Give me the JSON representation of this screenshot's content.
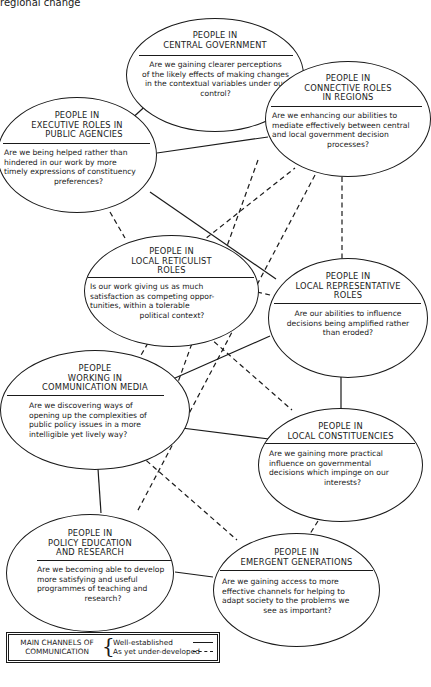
{
  "caption": "regional change",
  "nodes": [
    {
      "id": "central",
      "title": [
        "PEOPLE IN",
        "CENTRAL GOVERNMENT"
      ],
      "question": [
        "Are we gaining clearer perceptions",
        "of the likely effects of making changes",
        "in the contextual variables under our",
        "control?"
      ]
    },
    {
      "id": "connective",
      "title": [
        "PEOPLE IN",
        "CONNECTIVE ROLES",
        "IN REGIONS"
      ],
      "question": [
        "Are we enhancing our abilities to",
        "mediate effectively between central",
        "and local government decision",
        "processes?"
      ]
    },
    {
      "id": "executive",
      "title": [
        "PEOPLE IN",
        "EXECUTIVE ROLES IN",
        "PUBLIC AGENCIES"
      ],
      "question": [
        "Are we being helped rather than",
        "hindered in our work by more",
        "timely expressions of constituency",
        "preferences?"
      ]
    },
    {
      "id": "reticulist",
      "title": [
        "PEOPLE IN",
        "LOCAL RETICULIST",
        "ROLES"
      ],
      "question": [
        "Is our work giving us as much",
        "satisfaction as competing oppor-",
        "tunities, within a tolerable",
        "political context?"
      ]
    },
    {
      "id": "representative",
      "title": [
        "PEOPLE IN",
        "LOCAL REPRESENTATIVE",
        "ROLES"
      ],
      "question": [
        "Are our abilities to influence",
        "decisions being amplified rather",
        "than eroded?"
      ]
    },
    {
      "id": "media",
      "title": [
        "PEOPLE",
        "WORKING IN",
        "COMMUNICATION MEDIA"
      ],
      "question": [
        "Are we discovering ways of",
        "opening up the complexities of",
        "public policy issues in a more",
        "intelligible yet lively way?"
      ]
    },
    {
      "id": "constituencies",
      "title": [
        "PEOPLE IN",
        "LOCAL CONSTITUENCIES"
      ],
      "question": [
        "Are we gaining more practical",
        "influence on governmental",
        "decisions which impinge on our",
        "interests?"
      ]
    },
    {
      "id": "education",
      "title": [
        "PEOPLE IN",
        "POLICY EDUCATION",
        "AND RESEARCH"
      ],
      "question": [
        "Are we becoming able to develop",
        "more satisfying and useful",
        "programmes of teaching and",
        "research?"
      ]
    },
    {
      "id": "emergent",
      "title": [
        "PEOPLE IN",
        "EMERGENT GENERATIONS"
      ],
      "question": [
        "Are we gaining access to more",
        "effective channels for helping to",
        "adapt society to the problems we",
        "see as important?"
      ]
    }
  ],
  "links": {
    "well_established": [
      [
        "central",
        "executive"
      ],
      [
        "central",
        "connective"
      ],
      [
        "executive",
        "connective"
      ],
      [
        "executive",
        "representative"
      ],
      [
        "representative",
        "media"
      ],
      [
        "representative",
        "constituencies"
      ],
      [
        "media",
        "constituencies"
      ],
      [
        "media",
        "education"
      ],
      [
        "education",
        "emergent"
      ]
    ],
    "under_developed": [
      [
        "executive",
        "reticulist"
      ],
      [
        "reticulist",
        "connective"
      ],
      [
        "connective",
        "representative"
      ],
      [
        "reticulist",
        "representative"
      ],
      [
        "reticulist",
        "media"
      ],
      [
        "reticulist",
        "constituencies"
      ],
      [
        "connective",
        "education"
      ],
      [
        "connective",
        "media"
      ],
      [
        "media",
        "emergent"
      ],
      [
        "constituencies",
        "emergent"
      ]
    ]
  },
  "legend": {
    "heading": [
      "MAIN CHANNELS OF",
      "COMMUNICATION"
    ],
    "brace": "{",
    "items": [
      {
        "label": "Well-established",
        "style": "solid"
      },
      {
        "label": "As yet under-developed",
        "style": "dashed"
      }
    ]
  }
}
